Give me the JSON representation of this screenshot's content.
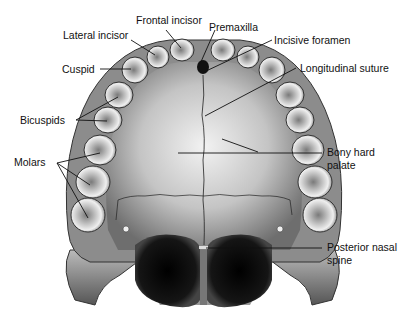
{
  "figure": {
    "labels": {
      "frontal_incisor": "Frontal incisor",
      "lateral_incisor": "Lateral incisor",
      "premaxilla": "Premaxilla",
      "incisive_foramen": "Incisive foramen",
      "cuspid": "Cuspid",
      "longitudinal_suture": "Longitudinal suture",
      "bicuspids": "Bicuspids",
      "molars": "Molars",
      "bony_hard_palate_line1": "Bony hard",
      "bony_hard_palate_line2": "palate",
      "posterior_nasal_spine_line1": "Posterior nasal",
      "posterior_nasal_spine_line2": "spine"
    }
  },
  "colors": {
    "background": "#ffffff",
    "leader_line": "#111111",
    "bone_light": "#e6e6e6",
    "bone_mid": "#a8a8a8",
    "bone_dark": "#555555",
    "cavity": "#0d0d0d"
  }
}
